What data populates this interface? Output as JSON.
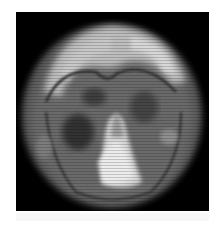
{
  "image": {
    "subject": "axial brain scan slice",
    "colormap": "grayscale",
    "background_color": "#000000",
    "page_color": "#ffffff"
  }
}
